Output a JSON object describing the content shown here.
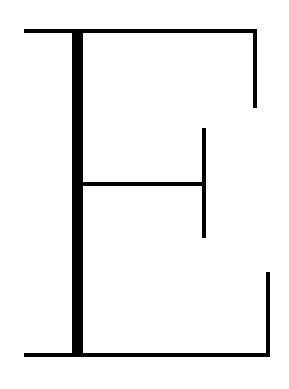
{
  "canvas": {
    "width": 289,
    "height": 389,
    "background_color": "#ffffff",
    "stroke_color": "#000000"
  },
  "artwork": {
    "title": "Stylized Letter E",
    "subject": "letter-E",
    "style": "abstract line drawing",
    "description": "An outline rendering of a serif capital letter E formed from one thick vertical stem and thin horizontal and vertical strokes.",
    "stroke_weights": {
      "thick_stem": 11,
      "thin_line": 4
    },
    "strokes": [
      {
        "id": "top-arm-horizontal",
        "name": "top-arm-horizontal",
        "orientation": "horizontal",
        "x": 24,
        "y": 29,
        "length": 233,
        "thickness": 4
      },
      {
        "id": "top-arm-terminal-vertical",
        "name": "top-arm-terminal-vertical",
        "orientation": "vertical",
        "x": 253,
        "y": 29,
        "length": 79,
        "thickness": 4
      },
      {
        "id": "main-stem",
        "name": "main-stem",
        "orientation": "vertical",
        "x": 72,
        "y": 29,
        "length": 328,
        "thickness": 11
      },
      {
        "id": "middle-arm-horizontal",
        "name": "middle-arm-horizontal",
        "orientation": "horizontal",
        "x": 82,
        "y": 182,
        "length": 124,
        "thickness": 4
      },
      {
        "id": "middle-arm-terminal-vertical",
        "name": "middle-arm-terminal-vertical",
        "orientation": "vertical",
        "x": 202,
        "y": 128,
        "length": 110,
        "thickness": 4
      },
      {
        "id": "bottom-arm-horizontal",
        "name": "bottom-arm-horizontal",
        "orientation": "horizontal",
        "x": 24,
        "y": 353,
        "length": 246,
        "thickness": 4
      },
      {
        "id": "bottom-arm-terminal-vertical",
        "name": "bottom-arm-terminal-vertical",
        "orientation": "vertical",
        "x": 266,
        "y": 272,
        "length": 85,
        "thickness": 4
      }
    ]
  }
}
